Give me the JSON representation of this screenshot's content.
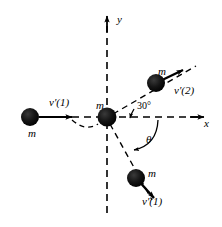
{
  "figure": {
    "type": "physics-vector-diagram",
    "width": 222,
    "height": 227,
    "background_color": "#ffffff",
    "line_color": "#000000",
    "mass_color": "#1a1a1a"
  },
  "axes": {
    "x_label": "x",
    "y_label": "y",
    "origin": {
      "x": 107,
      "y": 117
    },
    "style": "dashed",
    "x_arrow": true,
    "y_arrow": true
  },
  "angles": {
    "upper_label": "30°",
    "upper_value": 30,
    "lower_label": "θ",
    "lower_name": "theta"
  },
  "masses": [
    {
      "id": "incoming-mass",
      "label": "m",
      "position": {
        "x": 30,
        "y": 117
      },
      "radius": 9,
      "velocity_label": "v′(1)",
      "velocity_direction": "right",
      "state": "moving"
    },
    {
      "id": "target-mass",
      "label": "m",
      "position": {
        "x": 107,
        "y": 117
      },
      "radius": 9,
      "velocity_label": "",
      "velocity_direction": "none",
      "state": "at-rest"
    },
    {
      "id": "scattered-mass-upper",
      "label": "m",
      "position": {
        "x": 156,
        "y": 83
      },
      "radius": 9,
      "velocity_label": "v′(2)",
      "velocity_direction": "up-right-30deg",
      "state": "moving"
    },
    {
      "id": "scattered-mass-lower",
      "label": "m",
      "position": {
        "x": 136,
        "y": 178
      },
      "radius": 9,
      "velocity_label": "v′(1)",
      "velocity_direction": "down-right",
      "state": "moving"
    }
  ],
  "labels": {
    "m": "m",
    "v_prime_1": "v′(1)",
    "v_prime_2": "v′(2)",
    "axis_x": "x",
    "axis_y": "y",
    "angle_30": "30°",
    "angle_theta": "θ"
  }
}
